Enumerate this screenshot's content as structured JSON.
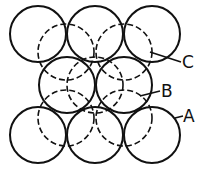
{
  "diagram": {
    "radius": 28,
    "layers": {
      "A": {
        "style": "solid",
        "centers": [
          [
            38,
            34
          ],
          [
            95,
            34
          ],
          [
            152,
            34
          ],
          [
            38,
            135
          ],
          [
            95,
            135
          ],
          [
            152,
            135
          ]
        ]
      },
      "B": {
        "style": "solid",
        "centers": [
          [
            67,
            85
          ],
          [
            124,
            85
          ]
        ]
      },
      "C": {
        "style": "dashed",
        "centers": [
          [
            66,
            52
          ],
          [
            124,
            52
          ],
          [
            66,
            118
          ],
          [
            124,
            118
          ],
          [
            95,
            85
          ]
        ]
      }
    },
    "labels": [
      {
        "text": "C",
        "x": 182,
        "y": 54,
        "leader": [
          150,
          52,
          181,
          62
        ]
      },
      {
        "text": "B",
        "x": 161,
        "y": 83,
        "leader": [
          140,
          96,
          160,
          91
        ]
      },
      {
        "text": "A",
        "x": 183,
        "y": 108,
        "leader": [
          175,
          118,
          183,
          116
        ]
      }
    ]
  }
}
